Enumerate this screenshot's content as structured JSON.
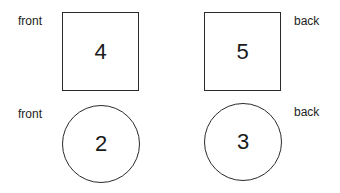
{
  "cards": [
    {
      "shape": "square",
      "side_label": "front",
      "number": "4"
    },
    {
      "shape": "square",
      "side_label": "back",
      "number": "5"
    },
    {
      "shape": "circle",
      "side_label": "front",
      "number": "2"
    },
    {
      "shape": "circle",
      "side_label": "back",
      "number": "3"
    }
  ]
}
